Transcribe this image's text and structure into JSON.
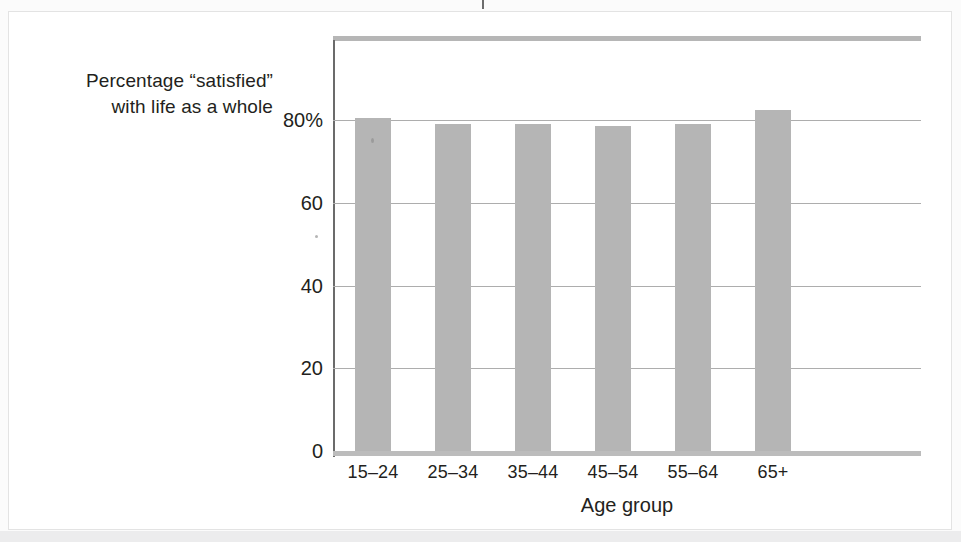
{
  "figure": {
    "background_color": "#fbfbfb",
    "panel_color": "#ffffff",
    "bar_color": "#b5b5b5",
    "axis_color": "#6b6b6b",
    "grid_color": "#adadad",
    "text_color": "#231f20"
  },
  "chart_data": {
    "type": "bar",
    "title": "",
    "ylabel": "Percentage “satisfied” with life as a whole",
    "ylabel_lines": [
      "Percentage “satisfied”",
      "with life as a whole"
    ],
    "xlabel": "Age group",
    "categories": [
      "15–24",
      "25–34",
      "35–44",
      "45–54",
      "55–64",
      "65+"
    ],
    "values": [
      80.5,
      79,
      79,
      78.5,
      79,
      82.5
    ],
    "ylim": [
      0,
      95
    ],
    "yticks": [
      0,
      20,
      40,
      60,
      80
    ],
    "ytick_labels": [
      "0",
      "20",
      "40",
      "60",
      "80%"
    ],
    "grid": "horizontal",
    "legend": "none"
  }
}
